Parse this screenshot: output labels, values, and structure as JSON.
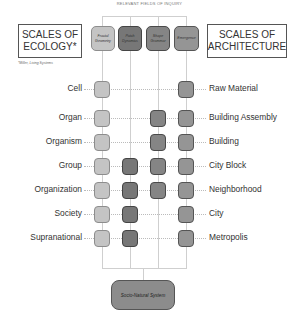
{
  "title": "RELEVANT FIELDS OF INQUIRY",
  "left_panel": {
    "title_line1": "SCALES OF",
    "title_line2": "ECOLOGY*",
    "footnote": "*Miller, Living Systems"
  },
  "right_panel": {
    "title_line1": "SCALES OF",
    "title_line2": "ARCHITECTURE"
  },
  "fields": [
    {
      "label_line1": "Fractal",
      "label_line2": "Geometry",
      "color": "#c4c4c4"
    },
    {
      "label_line1": "Patch",
      "label_line2": "Dynamics",
      "color": "#777777"
    },
    {
      "label_line1": "Shape",
      "label_line2": "Grammar",
      "color": "#858585"
    },
    {
      "label_line1": "Emergence",
      "label_line2": "",
      "color": "#959595"
    }
  ],
  "rows": [
    {
      "ecology": "Cell",
      "architecture": "Raw Material",
      "fields": [
        true,
        false,
        false,
        true
      ]
    },
    {
      "ecology": "Organ",
      "architecture": "Building Assembly",
      "fields": [
        true,
        false,
        true,
        true
      ]
    },
    {
      "ecology": "Organism",
      "architecture": "Building",
      "fields": [
        true,
        false,
        true,
        true
      ]
    },
    {
      "ecology": "Group",
      "architecture": "City Block",
      "fields": [
        true,
        true,
        true,
        true
      ]
    },
    {
      "ecology": "Organization",
      "architecture": "Neighborhood",
      "fields": [
        true,
        true,
        true,
        true
      ]
    },
    {
      "ecology": "Society",
      "architecture": "City",
      "fields": [
        true,
        true,
        false,
        true
      ]
    },
    {
      "ecology": "Supranational",
      "architecture": "Metropolis",
      "fields": [
        true,
        true,
        false,
        true
      ]
    }
  ],
  "bottom": {
    "label": "Socio-Natural System"
  }
}
